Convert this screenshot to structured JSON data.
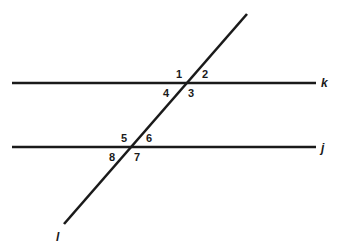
{
  "diagram": {
    "lines": {
      "k": {
        "label": "k",
        "y": 83,
        "x1": 12,
        "x2": 316
      },
      "j": {
        "label": "j",
        "y": 147,
        "x1": 12,
        "x2": 316
      },
      "l": {
        "label": "l",
        "x1": 247,
        "y1": 14,
        "x2": 64,
        "y2": 224
      }
    },
    "angles": [
      {
        "id": "1",
        "label": "1"
      },
      {
        "id": "2",
        "label": "2"
      },
      {
        "id": "3",
        "label": "3"
      },
      {
        "id": "4",
        "label": "4"
      },
      {
        "id": "5",
        "label": "5"
      },
      {
        "id": "6",
        "label": "6"
      },
      {
        "id": "7",
        "label": "7"
      },
      {
        "id": "8",
        "label": "8"
      }
    ],
    "colors": {
      "stroke": "#1a1a1a",
      "background": "#ffffff"
    }
  }
}
